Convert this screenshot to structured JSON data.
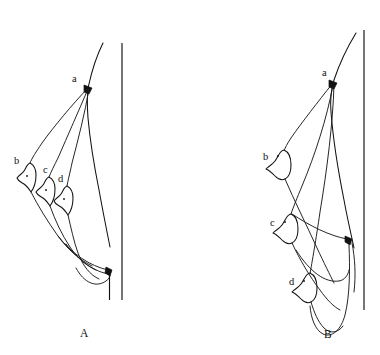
{
  "figure": {
    "background_color": "#ffffff",
    "ink_color": "#111111",
    "width": 380,
    "height": 355,
    "panels": [
      {
        "id": "panel-a",
        "label": "A",
        "label_x": 80,
        "label_y": 337,
        "apex": {
          "key": "a",
          "label": "a",
          "label_x": 72,
          "label_y": 82,
          "point_x": 88,
          "point_y": 89
        },
        "nodules": [
          {
            "key": "b",
            "label": "b",
            "label_x": 14,
            "label_y": 164,
            "dot_x": 27,
            "dot_y": 176
          },
          {
            "key": "c",
            "label": "c",
            "label_x": 43,
            "label_y": 173,
            "dot_x": 46,
            "dot_y": 188
          },
          {
            "key": "d",
            "label": "d",
            "label_x": 58,
            "label_y": 182,
            "dot_x": 64,
            "dot_y": 197
          }
        ],
        "axis": {
          "x": 122,
          "y_top": 43,
          "y_bottom": 300
        }
      },
      {
        "id": "panel-b",
        "label": "B",
        "label_x": 328,
        "label_y": 338,
        "apex": {
          "key": "a",
          "label": "a",
          "label_x": 322,
          "label_y": 76,
          "point_x": 333,
          "point_y": 84
        },
        "nodules": [
          {
            "key": "b",
            "label": "b",
            "label_x": 263,
            "label_y": 156,
            "dot_x": 278,
            "dot_y": 155
          },
          {
            "key": "c",
            "label": "c",
            "label_x": 270,
            "label_y": 222,
            "dot_x": 285,
            "dot_y": 221
          },
          {
            "key": "d",
            "label": "d",
            "label_x": 290,
            "label_y": 281,
            "dot_x": 304,
            "dot_y": 281
          }
        ],
        "axis": {
          "x": 364,
          "y_top": 30,
          "y_bottom": 310
        }
      }
    ]
  }
}
